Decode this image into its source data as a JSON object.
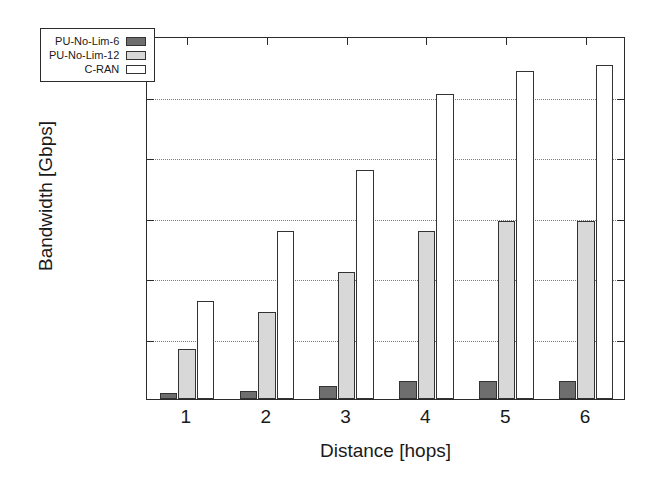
{
  "chart_data": {
    "type": "bar",
    "title": "",
    "xlabel": "Distance [hops]",
    "ylabel": "Bandwidth [Gbps]",
    "categories": [
      "1",
      "2",
      "3",
      "4",
      "5",
      "6"
    ],
    "series": [
      {
        "name": "PU-No-Lim-6",
        "color": "#6e6e6e",
        "values": [
          500,
          700,
          1100,
          1450,
          1500,
          1500
        ]
      },
      {
        "name": "PU-No-Lim-12",
        "color": "#d8d8d8",
        "values": [
          4100,
          7200,
          10500,
          13900,
          14700,
          14700
        ]
      },
      {
        "name": "C-RAN",
        "color": "#ffffff",
        "values": [
          8100,
          13900,
          18900,
          25200,
          27100,
          27600
        ]
      }
    ],
    "ylim": [
      0,
      30000
    ],
    "yticks": [
      0,
      5000,
      10000,
      15000,
      20000,
      25000,
      30000
    ],
    "ytick_labels": [
      "0",
      "5000",
      "10000",
      "15000",
      "20000",
      "25000",
      "30000"
    ],
    "grid": true,
    "grid_style": "dotted-horizontal",
    "legend_position": "upper-left-inside",
    "legend": [
      "PU-No-Lim-6",
      "PU-No-Lim-12",
      "C-RAN"
    ]
  }
}
